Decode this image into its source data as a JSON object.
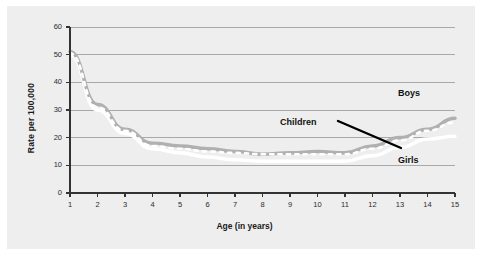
{
  "chart_data": {
    "type": "line",
    "title": "",
    "subtitle": "",
    "xlabel": "Age (in years)",
    "ylabel": "Rate per 100,000",
    "x": [
      1,
      2,
      3,
      4,
      5,
      6,
      7,
      8,
      9,
      10,
      11,
      12,
      13,
      14,
      15
    ],
    "xtick_labels": [
      "1",
      "2",
      "3",
      "4",
      "5",
      "6",
      "7",
      "8",
      "9",
      "10",
      "11",
      "12",
      "13",
      "14",
      "15"
    ],
    "ytick_labels": [
      "0",
      "10",
      "20",
      "30",
      "40",
      "50",
      "60"
    ],
    "yticks": [
      0,
      10,
      20,
      30,
      40,
      50,
      60
    ],
    "xlim": [
      1,
      15
    ],
    "ylim": [
      0,
      60
    ],
    "grid": "horizontal",
    "legend_position": "inline-annotations",
    "series": [
      {
        "name": "Boys",
        "color": "#b0b0b0",
        "style": "solid",
        "values": [
          51,
          32,
          23,
          18,
          17,
          16,
          15,
          14,
          14.5,
          15,
          14.5,
          17,
          20,
          23,
          27
        ]
      },
      {
        "name": "Girls",
        "color": "#ffffff",
        "style": "solid",
        "values": [
          50,
          30,
          21.5,
          16,
          14.5,
          13,
          12,
          11.5,
          11.5,
          11.5,
          11.5,
          13.5,
          16.5,
          19.5,
          20.5
        ]
      },
      {
        "name": "Children",
        "color": "#ffffff",
        "style": "dotted",
        "values": [
          50.5,
          31,
          22.5,
          17,
          16,
          15,
          14.5,
          14,
          14,
          14,
          14,
          16,
          19,
          22.5,
          25.5
        ]
      }
    ],
    "annotations": [
      {
        "text": "Boys",
        "x": 14.6,
        "y": 37
      },
      {
        "text": "Girls",
        "x": 14.6,
        "y": 13
      },
      {
        "text": "Children",
        "x": 11.0,
        "y": 26,
        "pointer": true
      }
    ]
  },
  "axes": {
    "xlabel": "Age (in years)",
    "ylabel": "Rate per 100,000"
  },
  "annotations": {
    "boys": "Boys",
    "girls": "Girls",
    "children": "Children"
  },
  "colors": {
    "panel_background": "#eeeeee",
    "figure_background": "#ffffff",
    "axis": "#333333",
    "gridline": "#a9a9a9",
    "boys_line": "#b0b0b0",
    "girls_line": "#ffffff",
    "children_line": "#ffffff",
    "pointer": "#000000",
    "tick_text": "#2b2b2b"
  }
}
